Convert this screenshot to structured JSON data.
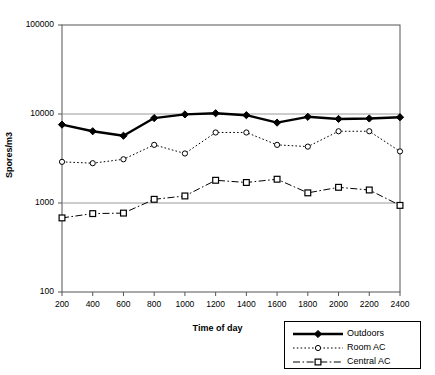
{
  "chart_data": {
    "type": "line",
    "title": "",
    "xlabel": "Time of day",
    "ylabel": "Spores/m3",
    "yscale": "log",
    "ylim": [
      100,
      100000
    ],
    "ytick_labels": [
      "100",
      "1000",
      "10000",
      "100000"
    ],
    "ytick_values": [
      100,
      1000,
      10000,
      100000
    ],
    "grid": "horizontal",
    "legend_position": "bottom-right",
    "x": [
      200,
      400,
      600,
      800,
      1000,
      1200,
      1400,
      1600,
      1800,
      2000,
      2200,
      2400
    ],
    "xtick_labels": [
      "200",
      "400",
      "600",
      "800",
      "1000",
      "1200",
      "1400",
      "1600",
      "1800",
      "2000",
      "2200",
      "2400"
    ],
    "series": [
      {
        "name": "Outdoors",
        "marker": "filled-diamond",
        "line_style": "solid",
        "line_width": 2.4,
        "color": "#000000",
        "values": [
          7600,
          6400,
          5700,
          9000,
          9900,
          10200,
          9700,
          8000,
          9300,
          8800,
          8900,
          9200
        ]
      },
      {
        "name": "Room AC",
        "marker": "open-circle",
        "line_style": "dotted",
        "line_width": 1,
        "color": "#000000",
        "values": [
          2900,
          2800,
          3100,
          4500,
          3600,
          6200,
          6200,
          4500,
          4300,
          6400,
          6400,
          3800
        ]
      },
      {
        "name": "Central AC",
        "marker": "open-square",
        "line_style": "dash-dot",
        "line_width": 1,
        "color": "#000000",
        "values": [
          680,
          760,
          770,
          1100,
          1200,
          1800,
          1700,
          1850,
          1300,
          1500,
          1400,
          940
        ]
      }
    ]
  },
  "legend": {
    "items": [
      {
        "label": "Outdoors"
      },
      {
        "label": "Room AC"
      },
      {
        "label": "Central AC"
      }
    ]
  }
}
